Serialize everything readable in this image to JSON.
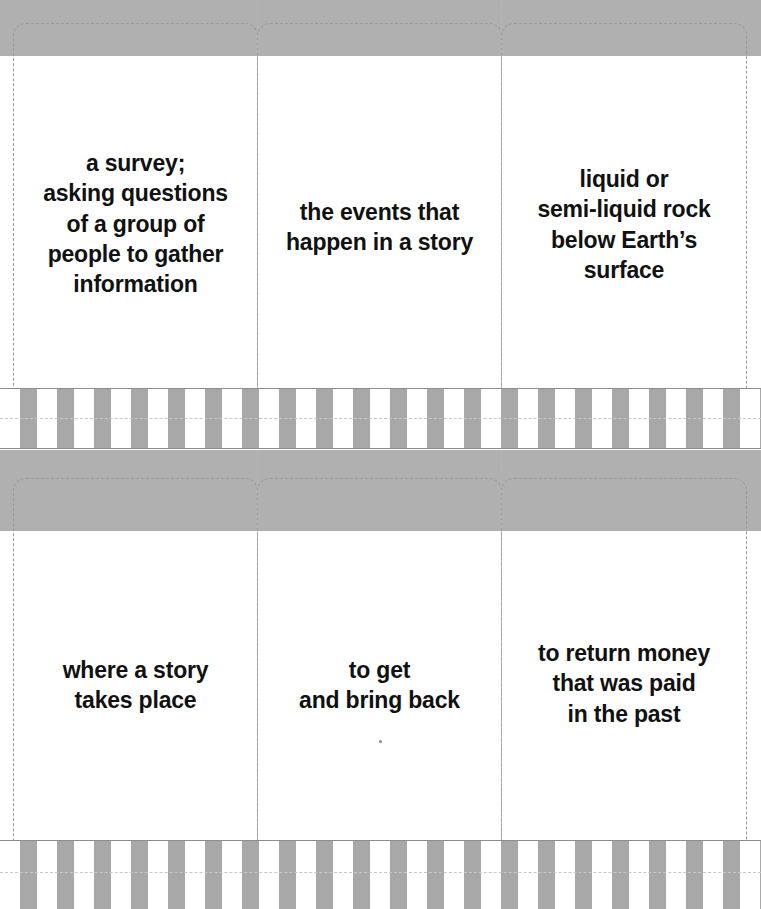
{
  "document": {
    "kind": "printable-flashcard-sheet",
    "sheet_count": 2,
    "columns_per_sheet": 3
  },
  "colors": {
    "band_gray": "#b0b0b0",
    "stripe_gray": "#a8a8a8",
    "paper_white": "#ffffff",
    "cut_line": "#9a9a9a",
    "text": "#111111"
  },
  "sheets": [
    {
      "id": "sheet-top",
      "cards": [
        {
          "id": "card-1",
          "text": "a survey;\nasking questions\nof a group of\npeople to gather\ninformation"
        },
        {
          "id": "card-2",
          "text": "the events that\nhappen in a story"
        },
        {
          "id": "card-3",
          "text": "liquid or\nsemi-liquid rock\nbelow Earth’s\nsurface"
        }
      ]
    },
    {
      "id": "sheet-bottom",
      "cards": [
        {
          "id": "card-4",
          "text": "where a story\ntakes place"
        },
        {
          "id": "card-5",
          "text": "to get\nand bring back"
        },
        {
          "id": "card-6",
          "text": "to return money\nthat was paid\nin the past"
        }
      ]
    }
  ]
}
